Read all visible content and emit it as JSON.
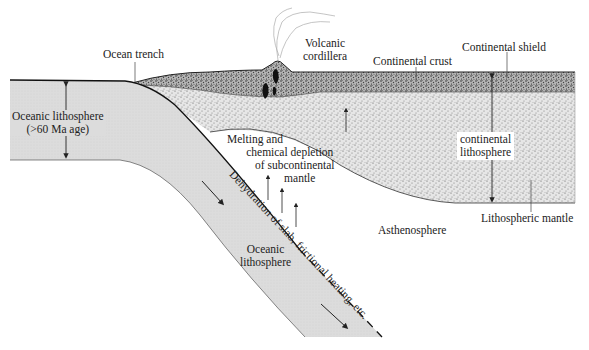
{
  "diagram": {
    "type": "subduction-zone cross-section",
    "labels": {
      "ocean_trench": "Ocean trench",
      "volcanic_cordillera_1": "Volcanic",
      "volcanic_cordillera_2": "cordillera",
      "continental_crust": "Continental crust",
      "continental_shield": "Continental shield",
      "oceanic_lithosphere_top_1": "Oceanic lithosphere",
      "oceanic_lithosphere_top_2": "(>60 Ma age)",
      "melting_1": "Melting and",
      "melting_2": "chemical depletion",
      "melting_3": "of subcontinental",
      "melting_4": "mantle",
      "continental_lithosphere_1": "continental",
      "continental_lithosphere_2": "lithosphere",
      "dehydration": "Dehydration of slab, frictional heating, etc.",
      "oceanic_lithosphere_slab_1": "Oceanic",
      "oceanic_lithosphere_slab_2": "lithosphere",
      "asthenosphere": "Asthenosphere",
      "lithospheric_mantle": "Lithospheric mantle"
    },
    "colors": {
      "oceanic_slab": "#d9d9d9",
      "crust": "#8a8a8a",
      "lithospheric_mantle": "#c8c8c8",
      "line": "#222222"
    }
  }
}
